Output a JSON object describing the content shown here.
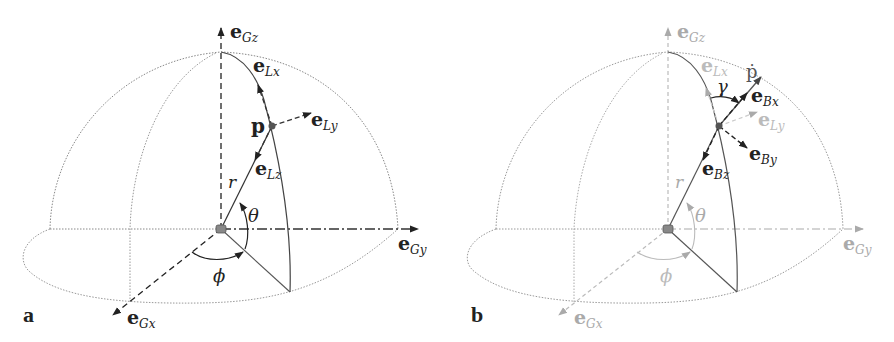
{
  "figure": {
    "panels": [
      {
        "id": "a",
        "letter": "a",
        "labels": {
          "eGz": {
            "base": "e",
            "sub": "Gz"
          },
          "eGy": {
            "base": "e",
            "sub": "Gy"
          },
          "eGx": {
            "base": "e",
            "sub": "Gx"
          },
          "eLx": {
            "base": "e",
            "sub": "Lx"
          },
          "eLy": {
            "base": "e",
            "sub": "Ly"
          },
          "eLz": {
            "base": "e",
            "sub": "Lz"
          },
          "point": "p",
          "radius": "r",
          "theta": "θ",
          "phi": "ϕ"
        }
      },
      {
        "id": "b",
        "letter": "b",
        "labels": {
          "eGz": {
            "base": "e",
            "sub": "Gz"
          },
          "eGy": {
            "base": "e",
            "sub": "Gy"
          },
          "eGx": {
            "base": "e",
            "sub": "Gx"
          },
          "eLx": {
            "base": "e",
            "sub": "Lx"
          },
          "eLy": {
            "base": "e",
            "sub": "Ly"
          },
          "eBx": {
            "base": "e",
            "sub": "Bx"
          },
          "eBy": {
            "base": "e",
            "sub": "By"
          },
          "eBz": {
            "base": "e",
            "sub": "Bz"
          },
          "velocity": "ṗ",
          "radius": "r",
          "theta": "θ",
          "phi": "ϕ",
          "gamma": "γ"
        }
      }
    ],
    "colors": {
      "ink": "#222222",
      "faded": "#aaaaaa",
      "dotted": "#888888",
      "origin": "#777777",
      "point": "#555555"
    }
  }
}
